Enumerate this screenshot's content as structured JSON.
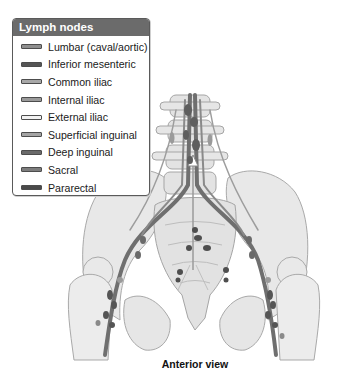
{
  "figure": {
    "caption": "Anterior view"
  },
  "legend": {
    "title": "Lymph nodes",
    "items": [
      {
        "label": "Lumbar (caval/aortic)",
        "color": "#8f8f8f"
      },
      {
        "label": "Inferior mesenteric",
        "color": "#555555"
      },
      {
        "label": "Common iliac",
        "color": "#a8a8a8"
      },
      {
        "label": "Internal iliac",
        "color": "#9a9a9a"
      },
      {
        "label": "External iliac",
        "color": "#f2f2f2"
      },
      {
        "label": "Superficial inguinal",
        "color": "#a4a4a4"
      },
      {
        "label": "Deep inguinal",
        "color": "#6a6a6a"
      },
      {
        "label": "Sacral",
        "color": "#7d7d7d"
      },
      {
        "label": "Pararectal",
        "color": "#4a4a4a"
      }
    ]
  },
  "colors": {
    "bone": "#e6e6e6",
    "bone_outline": "#a9a9a9",
    "vessel": "#6f6f6f",
    "node_dark": "#4e4e4e",
    "legend_header": "#6b6b6b"
  }
}
